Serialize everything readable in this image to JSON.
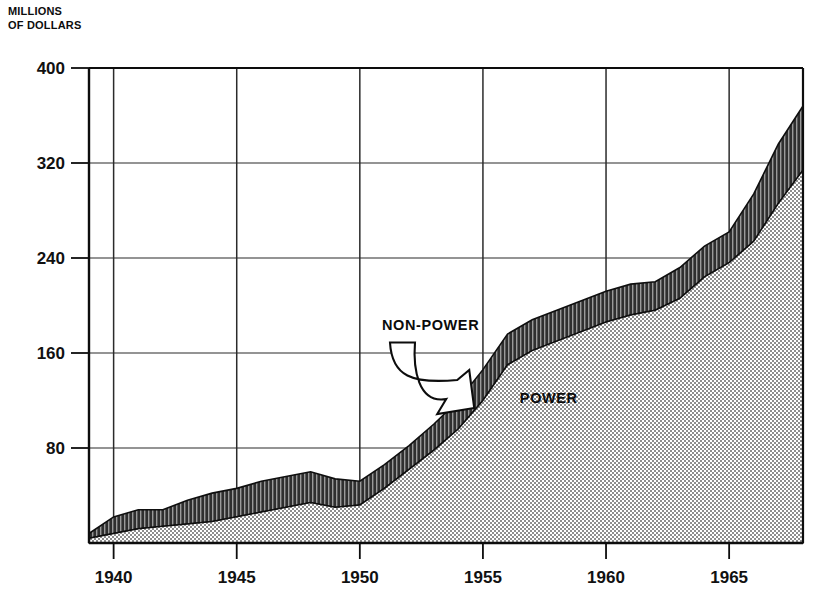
{
  "chart_data": {
    "type": "area",
    "title_line1": "MILLIONS",
    "title_line2": "OF DOLLARS",
    "xlabel": "",
    "ylabel": "MILLIONS OF DOLLARS",
    "stacked": true,
    "grid": true,
    "legend_position": "inline-annotations",
    "xlim": [
      1939,
      1968
    ],
    "ylim": [
      0,
      400
    ],
    "yticks": [
      80,
      160,
      240,
      320,
      400
    ],
    "ytick_labels": [
      "80",
      "160",
      "240",
      "320",
      "400"
    ],
    "xticks": [
      1940,
      1945,
      1950,
      1955,
      1960,
      1965
    ],
    "xtick_labels": [
      "1940",
      "1945",
      "1950",
      "1955",
      "1960",
      "1965"
    ],
    "x": [
      1939,
      1940,
      1941,
      1942,
      1943,
      1944,
      1945,
      1946,
      1947,
      1948,
      1949,
      1950,
      1951,
      1952,
      1953,
      1954,
      1955,
      1956,
      1957,
      1958,
      1959,
      1960,
      1961,
      1962,
      1963,
      1964,
      1965,
      1966,
      1967,
      1968
    ],
    "series": [
      {
        "name": "POWER",
        "label": "POWER",
        "fill": "stipple-light",
        "color": "#cfcfcf",
        "values": [
          4,
          8,
          12,
          14,
          16,
          18,
          22,
          26,
          30,
          34,
          30,
          32,
          46,
          62,
          78,
          96,
          120,
          150,
          162,
          170,
          178,
          186,
          192,
          196,
          206,
          224,
          236,
          254,
          286,
          314
        ]
      },
      {
        "name": "NON-POWER",
        "label": "NON-POWER",
        "fill": "hatch-dark",
        "color": "#3a3a3a",
        "values": [
          4,
          14,
          16,
          14,
          20,
          24,
          24,
          26,
          26,
          26,
          24,
          20,
          20,
          20,
          22,
          24,
          26,
          26,
          26,
          26,
          26,
          26,
          26,
          24,
          26,
          26,
          26,
          40,
          50,
          54
        ]
      }
    ],
    "totals": [
      8,
      22,
      28,
      28,
      36,
      42,
      46,
      52,
      56,
      60,
      54,
      52,
      66,
      82,
      100,
      120,
      146,
      176,
      188,
      196,
      204,
      212,
      218,
      220,
      232,
      250,
      262,
      294,
      336,
      368
    ],
    "annotations": [
      {
        "text": "NON-POWER",
        "x": 1950.9,
        "y": 179,
        "arrow": true,
        "arrow_to_x": 1954.2,
        "arrow_to_y": 112
      },
      {
        "text": "POWER",
        "x": 1956.5,
        "y": 118,
        "arrow": false
      }
    ]
  },
  "colors": {
    "axis": "#0d0d0d",
    "grid": "#2b2b2b",
    "power_fill": "#d5d5d5",
    "nonpower_fill": "#4a4a4a",
    "background": "#ffffff",
    "text": "#111111"
  },
  "icons": {
    "annotation_arrow": "curved-arrow-icon"
  }
}
